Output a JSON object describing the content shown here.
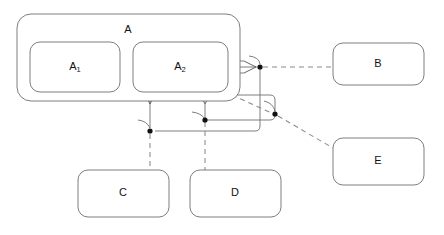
{
  "diagram": {
    "background_color": "#ffffff",
    "box_stroke_color": "#6f6f6f",
    "connector_color": "#8a8a8a",
    "junction_color": "#111111",
    "nodes": [
      {
        "id": "A",
        "label": "A",
        "label_main": "A",
        "label_sub": "",
        "type": "composite",
        "x": 17,
        "y": 14,
        "width": 223,
        "height": 87,
        "radius": 14,
        "label_x": 128,
        "label_y": 30
      },
      {
        "id": "A1",
        "label": "A1",
        "label_main": "A",
        "label_sub": "1",
        "type": "part",
        "x": 30,
        "y": 42,
        "width": 90,
        "height": 50,
        "radius": 10,
        "label_x": 75,
        "label_y": 67
      },
      {
        "id": "A2",
        "label": "A2",
        "label_main": "A",
        "label_sub": "2",
        "type": "part",
        "x": 133,
        "y": 42,
        "width": 95,
        "height": 50,
        "radius": 10,
        "label_x": 180,
        "label_y": 67
      },
      {
        "id": "B",
        "label": "B",
        "label_main": "B",
        "label_sub": "",
        "type": "plain",
        "x": 333,
        "y": 43,
        "width": 91,
        "height": 42,
        "radius": 10,
        "label_x": 378,
        "label_y": 64
      },
      {
        "id": "C",
        "label": "C",
        "label_main": "C",
        "label_sub": "",
        "type": "plain",
        "x": 78,
        "y": 170,
        "width": 91,
        "height": 47,
        "radius": 10,
        "label_x": 123,
        "label_y": 193
      },
      {
        "id": "D",
        "label": "D",
        "label_main": "D",
        "label_sub": "",
        "type": "plain",
        "x": 190,
        "y": 170,
        "width": 91,
        "height": 47,
        "radius": 10,
        "label_x": 235,
        "label_y": 193
      },
      {
        "id": "E",
        "label": "E",
        "label_main": "E",
        "label_sub": "",
        "type": "plain",
        "x": 333,
        "y": 138,
        "width": 91,
        "height": 47,
        "radius": 10,
        "label_x": 378,
        "label_y": 161
      }
    ],
    "junctions": [
      {
        "id": "j-b",
        "x": 260,
        "y": 67,
        "r": 2.6
      },
      {
        "id": "j-e",
        "x": 275,
        "y": 114,
        "r": 2.6
      },
      {
        "id": "j-c",
        "x": 150,
        "y": 131,
        "r": 2.6
      },
      {
        "id": "j-d",
        "x": 205,
        "y": 120,
        "r": 2.6
      }
    ],
    "connectors": [
      {
        "id": "a2-to-b",
        "from": "A2",
        "to": "B",
        "style": "dashed",
        "arrow": "open"
      },
      {
        "id": "a2-to-c",
        "from": "A2",
        "to": "C",
        "style": "dashed",
        "arrow": "open"
      },
      {
        "id": "a2-to-d",
        "from": "A2",
        "to": "D",
        "style": "dashed",
        "arrow": "open"
      },
      {
        "id": "a2-to-e",
        "from": "A2",
        "to": "E",
        "style": "dashed",
        "arrow": "hollow"
      }
    ]
  }
}
